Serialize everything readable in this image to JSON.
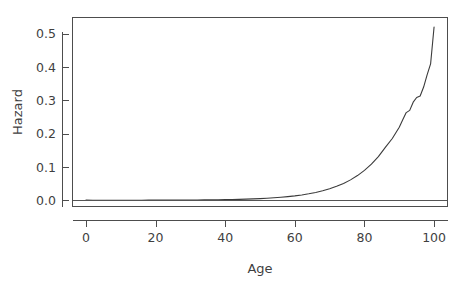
{
  "chart_data": {
    "type": "line",
    "title": "",
    "subtitle": "",
    "xlabel": "Age",
    "ylabel": "Hazard",
    "xlim": [
      -4,
      104
    ],
    "ylim": [
      -0.02,
      0.55
    ],
    "xticks": [
      0,
      20,
      40,
      60,
      80,
      100
    ],
    "xtick_labels": [
      "0",
      "20",
      "40",
      "60",
      "80",
      "100"
    ],
    "yticks": [
      0.0,
      0.1,
      0.2,
      0.3,
      0.4,
      0.5
    ],
    "ytick_labels": [
      "0.0",
      "0.1",
      "0.2",
      "0.3",
      "0.4",
      "0.5"
    ],
    "grid": false,
    "legend": false,
    "legend_position": "none",
    "box": true,
    "series": [
      {
        "name": "Hazard",
        "color": "#3b3b3b",
        "x": [
          0,
          2,
          4,
          6,
          8,
          10,
          12,
          14,
          16,
          18,
          20,
          22,
          24,
          26,
          28,
          30,
          32,
          34,
          36,
          38,
          40,
          42,
          44,
          46,
          48,
          50,
          52,
          54,
          56,
          58,
          60,
          62,
          64,
          66,
          68,
          70,
          72,
          74,
          76,
          78,
          80,
          82,
          84,
          86,
          88,
          90,
          91,
          92,
          93,
          94,
          95,
          96,
          97,
          98,
          99,
          100
        ],
        "y": [
          0.0006,
          0.0004,
          0.0003,
          0.0003,
          0.0003,
          0.0003,
          0.0003,
          0.0004,
          0.0004,
          0.0005,
          0.0006,
          0.0006,
          0.0007,
          0.0008,
          0.0009,
          0.001,
          0.0011,
          0.0013,
          0.0015,
          0.0018,
          0.0021,
          0.0025,
          0.003,
          0.0036,
          0.0043,
          0.0052,
          0.0063,
          0.0076,
          0.0092,
          0.0111,
          0.0134,
          0.0162,
          0.0196,
          0.0237,
          0.0287,
          0.0347,
          0.042,
          0.0508,
          0.0614,
          0.0743,
          0.0898,
          0.1086,
          0.1313,
          0.1588,
          0.1856,
          0.2194,
          0.2415,
          0.2632,
          0.2698,
          0.2945,
          0.3085,
          0.3129,
          0.3398,
          0.3766,
          0.4092,
          0.5198
        ]
      },
      {
        "name": "Reference",
        "color": "#555555",
        "x": [
          -4,
          104
        ],
        "y": [
          0.0,
          0.0
        ]
      }
    ]
  },
  "axes": {
    "y_title": "Hazard",
    "x_title": "Age"
  }
}
